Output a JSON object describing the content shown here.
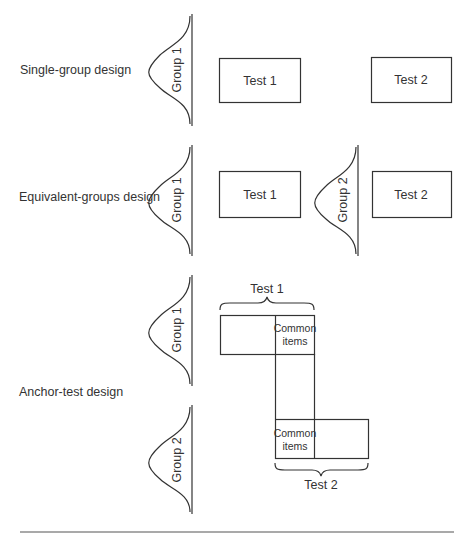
{
  "colors": {
    "stroke": "#333333",
    "text": "#333333",
    "background": "#ffffff"
  },
  "designs": [
    {
      "label": "Single-group design",
      "groups": [
        {
          "label": "Group 1"
        }
      ],
      "tests": [
        {
          "label": "Test 1"
        },
        {
          "label": "Test 2"
        }
      ]
    },
    {
      "label": "Equivalent-groups design",
      "groups": [
        {
          "label": "Group 1"
        },
        {
          "label": "Group 2"
        }
      ],
      "tests": [
        {
          "label": "Test 1"
        },
        {
          "label": "Test 2"
        }
      ]
    },
    {
      "label": "Anchor-test design",
      "groups": [
        {
          "label": "Group 1"
        },
        {
          "label": "Group 2"
        }
      ],
      "tests": [
        {
          "label": "Test 1"
        },
        {
          "label": "Test 2"
        }
      ],
      "common_items": {
        "line1": "Common",
        "line2": "items"
      }
    }
  ]
}
